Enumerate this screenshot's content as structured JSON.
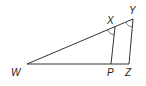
{
  "diagram": {
    "type": "geometry-triangle",
    "labels": {
      "W": "W",
      "X": "X",
      "Y": "Y",
      "P": "P",
      "Z": "Z"
    },
    "segments": [
      "WY",
      "WZ",
      "XP",
      "YZ"
    ],
    "marked_angles": [
      "WXP",
      "WYZ"
    ],
    "colors": {
      "line": "#333333",
      "arc": "#555555",
      "text": "#222222"
    }
  }
}
